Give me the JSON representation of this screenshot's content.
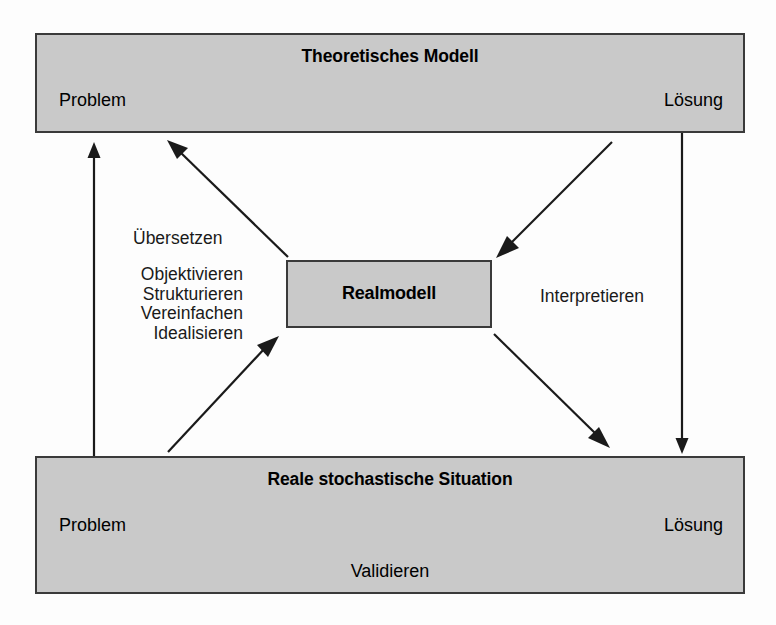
{
  "diagram": {
    "title_top": "Theoretisches Modell",
    "title_bottom": "Reale stochastische Situation",
    "center_box_label": "Realmodell",
    "top_box": {
      "left_label": "Problem",
      "right_label": "Lösung",
      "arrow_direction": "left-to-right"
    },
    "bottom_box": {
      "left_label": "Problem",
      "right_label": "Lösung",
      "arrow_direction": "right-to-left",
      "caption": "Validieren"
    },
    "left_labels": {
      "translate": "Übersetzen",
      "steps": [
        "Objektivieren",
        "Strukturieren",
        "Vereinfachen",
        "Idealisieren"
      ]
    },
    "right_label": "Interpretieren",
    "colors": {
      "box_fill": "#c9c9c9",
      "box_border": "#3a3a3a",
      "arrow": "#1a1a1a",
      "text": "#000000",
      "page_background": "#fdfdfd"
    }
  }
}
